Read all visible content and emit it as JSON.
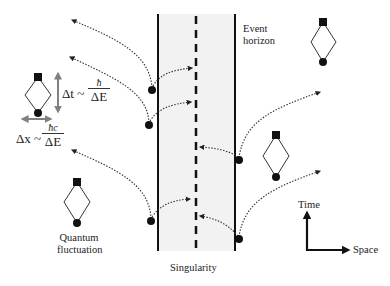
{
  "diagram": {
    "labels": {
      "event_horizon_line1": "Event",
      "event_horizon_line2": "horizon",
      "singularity": "Singularity",
      "quantum_fluctuation_line1": "Quantum",
      "quantum_fluctuation_line2": "fluctuation",
      "time_axis": "Time",
      "space_axis": "Space"
    },
    "equations": {
      "delta_t_lhs": "Δt ~",
      "delta_t_num": "ħ",
      "delta_t_den": "ΔE",
      "delta_x_lhs": "Δx ~",
      "delta_x_num": "ħc",
      "delta_x_den": "ΔE"
    },
    "colors": {
      "line": "#111111",
      "black_hole_region": "#f2f2f2",
      "uncertainty_arrow": "#808080",
      "dotted_path": "#333333"
    },
    "regions": [
      {
        "name": "black-hole-interior",
        "x_left": 158,
        "x_right": 235,
        "y_top": 14,
        "y_bottom": 251
      }
    ],
    "particle_pairs": [
      {
        "dot": [
          152,
          90
        ],
        "escape_to": [
          72,
          20
        ],
        "fall_to": [
          192,
          68
        ]
      },
      {
        "dot": [
          149,
          125
        ],
        "escape_to": [
          70,
          57
        ],
        "fall_to": [
          191,
          102
        ]
      },
      {
        "dot": [
          151,
          221
        ],
        "escape_to": [
          72,
          150
        ],
        "fall_to": [
          190,
          199
        ]
      },
      {
        "dot": [
          239,
          160
        ],
        "escape_to": [
          320,
          92
        ],
        "fall_to": [
          200,
          147
        ]
      },
      {
        "dot": [
          239,
          239
        ],
        "escape_to": [
          320,
          171
        ],
        "fall_to": [
          200,
          216
        ]
      }
    ],
    "fluctuation_loops": [
      {
        "top": [
          38,
          77
        ],
        "bottom": [
          38,
          113
        ]
      },
      {
        "top": [
          323,
          22
        ],
        "bottom": [
          323,
          62
        ]
      },
      {
        "top": [
          276,
          135
        ],
        "bottom": [
          276,
          177
        ]
      },
      {
        "top": [
          77,
          182
        ],
        "bottom": [
          77,
          223
        ]
      }
    ]
  }
}
